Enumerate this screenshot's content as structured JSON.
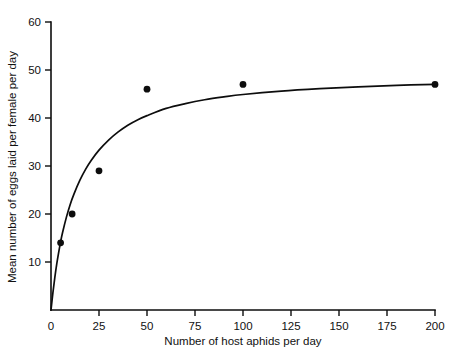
{
  "chart_data": {
    "type": "scatter",
    "title": "",
    "xlabel": "Number of host aphids per day",
    "ylabel": "Mean number of eggs laid per female per day",
    "xlim": [
      0,
      200
    ],
    "ylim": [
      0,
      60
    ],
    "xticks": [
      0,
      25,
      50,
      75,
      100,
      125,
      150,
      175,
      200
    ],
    "xtick_labels": [
      "0",
      "25",
      "50",
      "75",
      "100",
      "125",
      "150",
      "175",
      "200"
    ],
    "yticks": [
      10,
      20,
      30,
      40,
      50,
      60
    ],
    "ytick_labels": [
      "10",
      "20",
      "30",
      "40",
      "50",
      "60"
    ],
    "grid": false,
    "legend": "none",
    "series": [
      {
        "name": "observed",
        "marker": "filled-circle",
        "color": "#0d0d0d",
        "points": [
          {
            "x": 5,
            "y": 14
          },
          {
            "x": 11,
            "y": 20
          },
          {
            "x": 25,
            "y": 29
          },
          {
            "x": 50,
            "y": 46
          },
          {
            "x": 100,
            "y": 47
          },
          {
            "x": 200,
            "y": 47
          }
        ]
      },
      {
        "name": "fitted-curve",
        "marker": "none",
        "color": "#0d0d0d",
        "model": "saturating",
        "points": [
          {
            "x": 0,
            "y": 0
          },
          {
            "x": 1,
            "y": 3.6
          },
          {
            "x": 2,
            "y": 6.8
          },
          {
            "x": 3,
            "y": 9.6
          },
          {
            "x": 4,
            "y": 12.0
          },
          {
            "x": 5,
            "y": 14.2
          },
          {
            "x": 6,
            "y": 16.1
          },
          {
            "x": 8,
            "y": 19.3
          },
          {
            "x": 10,
            "y": 22.0
          },
          {
            "x": 12,
            "y": 24.2
          },
          {
            "x": 15,
            "y": 27.0
          },
          {
            "x": 18,
            "y": 29.3
          },
          {
            "x": 21,
            "y": 31.2
          },
          {
            "x": 25,
            "y": 33.3
          },
          {
            "x": 30,
            "y": 35.4
          },
          {
            "x": 35,
            "y": 37.1
          },
          {
            "x": 40,
            "y": 38.5
          },
          {
            "x": 45,
            "y": 39.6
          },
          {
            "x": 50,
            "y": 40.5
          },
          {
            "x": 60,
            "y": 42.0
          },
          {
            "x": 70,
            "y": 43.0
          },
          {
            "x": 80,
            "y": 43.8
          },
          {
            "x": 90,
            "y": 44.4
          },
          {
            "x": 100,
            "y": 44.9
          },
          {
            "x": 120,
            "y": 45.6
          },
          {
            "x": 140,
            "y": 46.1
          },
          {
            "x": 160,
            "y": 46.5
          },
          {
            "x": 180,
            "y": 46.8
          },
          {
            "x": 200,
            "y": 47.0
          }
        ]
      }
    ]
  },
  "axes": {
    "x_title": "Number of host aphids per day",
    "y_title": "Mean number of eggs laid per female per day"
  }
}
